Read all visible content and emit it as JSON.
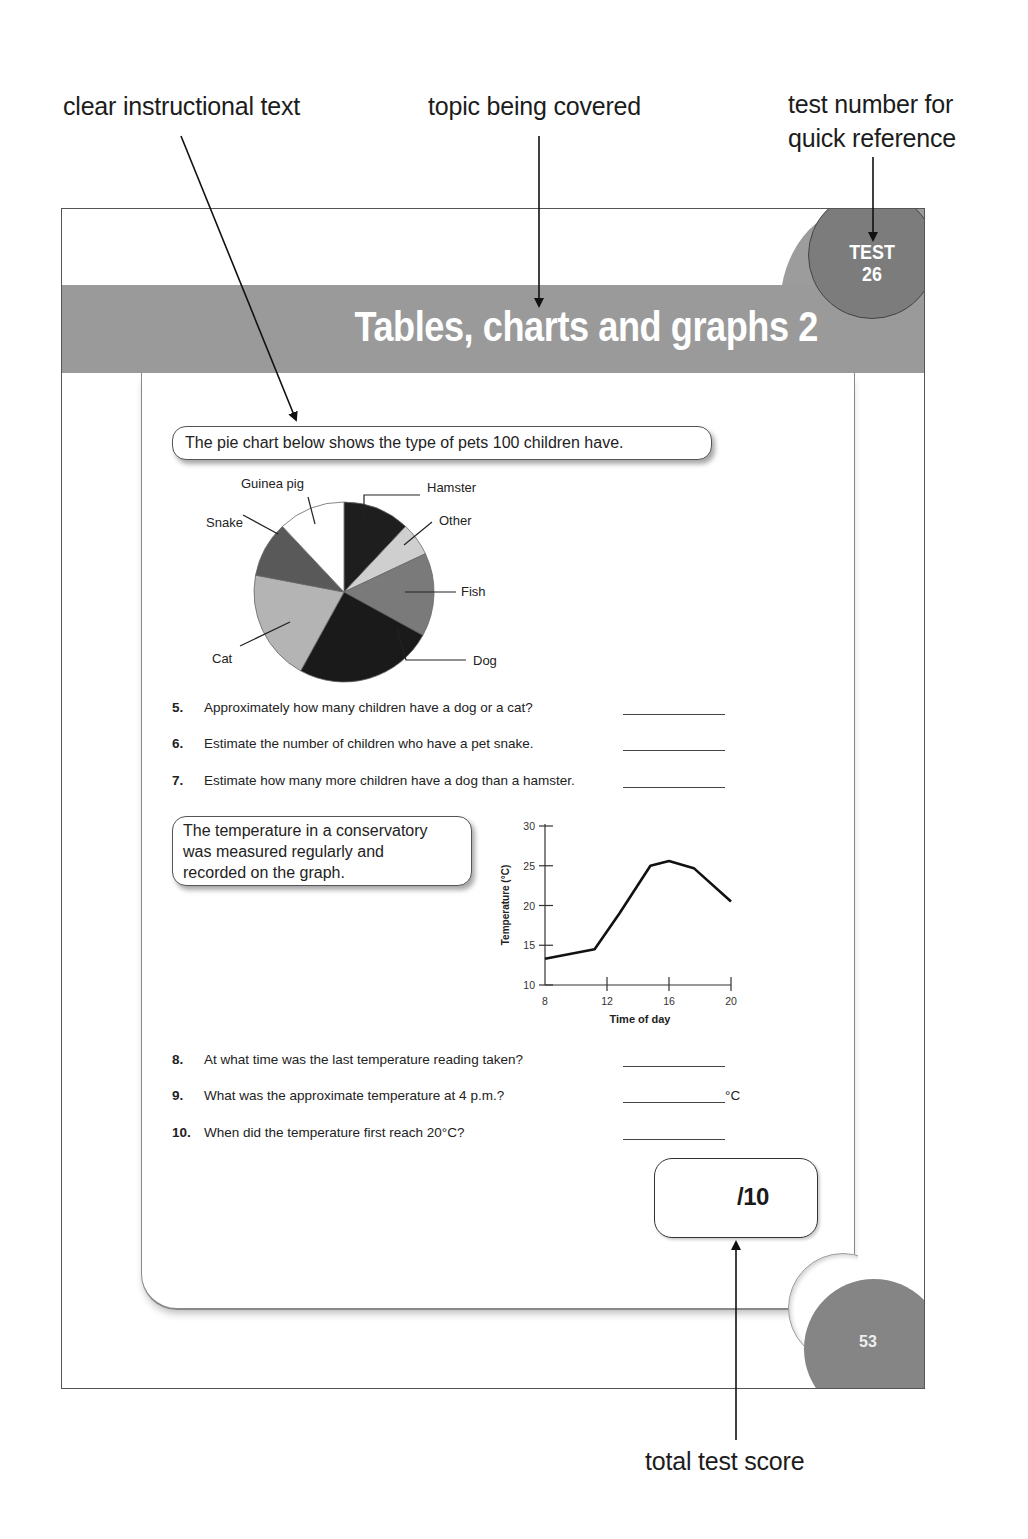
{
  "callouts": {
    "instructional": "clear instructional text",
    "topic": "topic being covered",
    "test_number_line1": "test number for",
    "test_number_line2": "quick reference",
    "total_score": "total test score"
  },
  "header": {
    "title": "Tables, charts and graphs 2",
    "test_label": "TEST",
    "test_number": "26"
  },
  "section1": {
    "instruction": "The pie chart below shows the type of pets 100 children have.",
    "questions": [
      {
        "num": "5.",
        "text": "Approximately how many children have a dog or a cat?",
        "unit": ""
      },
      {
        "num": "6.",
        "text": "Estimate the number of children who have a pet snake.",
        "unit": ""
      },
      {
        "num": "7.",
        "text": "Estimate how many more children have a dog than a hamster.",
        "unit": ""
      }
    ]
  },
  "section2": {
    "instruction_lines": [
      "The temperature in a conservatory",
      "was measured regularly and",
      "recorded on the graph."
    ],
    "questions": [
      {
        "num": "8.",
        "text": "At what time was the last temperature reading taken?",
        "unit": ""
      },
      {
        "num": "9.",
        "text": "What was the approximate temperature at 4 p.m.?",
        "unit": "°C"
      },
      {
        "num": "10.",
        "text": "When did the temperature first reach 20°C?",
        "unit": ""
      }
    ]
  },
  "score": {
    "label": "/10"
  },
  "page_number": "53",
  "chart_data": [
    {
      "type": "pie",
      "title": "The pie chart below shows the type of pets 100 children have.",
      "categories": [
        "Hamster",
        "Other",
        "Fish",
        "Dog",
        "Cat",
        "Snake",
        "Guinea pig"
      ],
      "values": [
        12,
        6,
        15,
        25,
        20,
        10,
        12
      ],
      "colors": [
        "#1e1e1e",
        "#cfcfcf",
        "#7a7a7a",
        "#1a1a1a",
        "#b4b4b4",
        "#595959",
        "#ffffff"
      ],
      "start_angle": "12 o'clock, clockwise"
    },
    {
      "type": "line",
      "title": "",
      "xlabel": "Time of day",
      "ylabel": "Temperature (°C)",
      "x_ticks": [
        8,
        12,
        16,
        20
      ],
      "y_ticks": [
        10,
        15,
        20,
        25,
        30
      ],
      "xlim": [
        8,
        20
      ],
      "ylim": [
        10,
        30
      ],
      "grid": false,
      "x": [
        8,
        11.2,
        12.8,
        14.8,
        16,
        17.6,
        20
      ],
      "values": [
        13.3,
        14.5,
        19,
        25,
        25.6,
        24.7,
        20.5
      ]
    }
  ]
}
